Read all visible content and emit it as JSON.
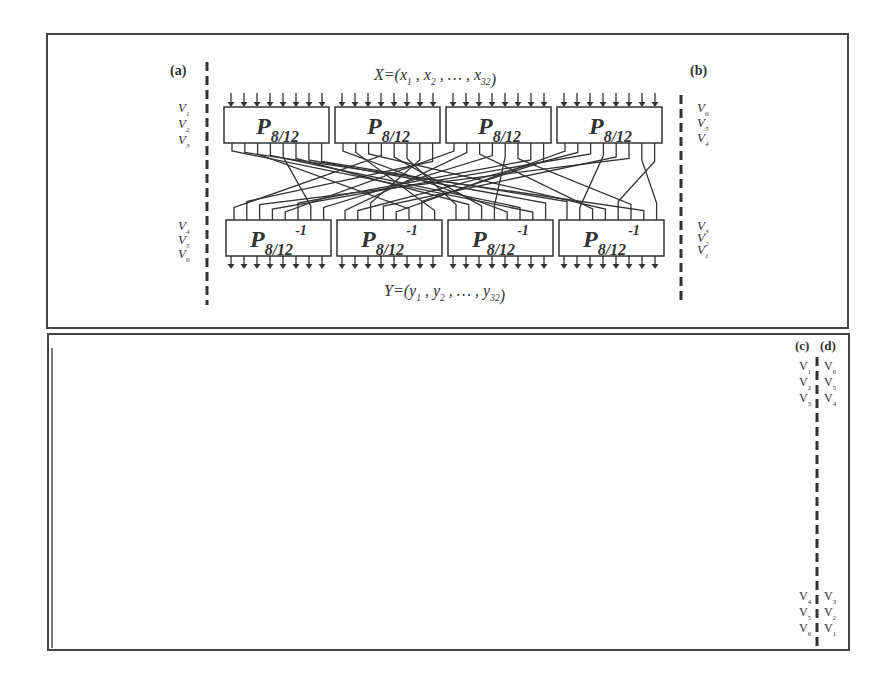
{
  "top_panel": {
    "label_left": "(a)",
    "label_right": "(b)",
    "input_label": "X=(x",
    "input_formula": {
      "prefix": "X=(",
      "terms": [
        [
          "x",
          "1"
        ],
        [
          "x",
          "2"
        ],
        [
          "…",
          ""
        ],
        [
          "x",
          "32"
        ]
      ],
      "suffix": ")"
    },
    "output_formula": {
      "prefix": "Y=(",
      "terms": [
        [
          "y",
          "1"
        ],
        [
          "y",
          "2"
        ],
        [
          "…",
          ""
        ],
        [
          "y",
          "32"
        ]
      ],
      "suffix": ")"
    },
    "box_main": "P",
    "box_sub": "8/12",
    "box_inv_sup": "-1",
    "box_count": 4,
    "arrows_per_box": 8,
    "left_top_v": [
      [
        "V",
        "1"
      ],
      [
        "V",
        "2"
      ],
      [
        "V",
        "3"
      ]
    ],
    "left_bottom_v": [
      [
        "V",
        "4"
      ],
      [
        "V",
        "5"
      ],
      [
        "V",
        "6"
      ]
    ],
    "right_top_v": [
      [
        "V",
        "6"
      ],
      [
        "V",
        "5"
      ],
      [
        "V",
        "4"
      ]
    ],
    "right_bottom_v": [
      [
        "V",
        "3"
      ],
      [
        "V",
        "2"
      ],
      [
        "V",
        "1"
      ]
    ]
  },
  "bottom_panel": {
    "label_left": "(c)",
    "label_right": "(d)",
    "box_main": "P",
    "box_sub": "8/12",
    "box_inv_sup": "-1",
    "box_count": 8,
    "arrows_per_box": 8,
    "c_top_v": [
      [
        "V",
        "1"
      ],
      [
        "V",
        "2"
      ],
      [
        "V",
        "3"
      ]
    ],
    "d_top_v": [
      [
        "V",
        "6"
      ],
      [
        "V",
        "5"
      ],
      [
        "V",
        "4"
      ]
    ],
    "c_bottom_v": [
      [
        "V",
        "4"
      ],
      [
        "V",
        "5"
      ],
      [
        "V",
        "6"
      ]
    ],
    "d_bottom_v": [
      [
        "V",
        "3"
      ],
      [
        "V",
        "2"
      ],
      [
        "V",
        "1"
      ]
    ]
  },
  "colors": {
    "stroke": "#333333",
    "background": "#ffffff"
  }
}
